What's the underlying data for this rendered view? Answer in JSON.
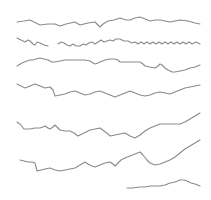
{
  "drawing": {
    "background": "#ffffff",
    "stroke_color": "#8a8a8a",
    "stroke_width": 1.1,
    "line_count": 7,
    "lines": [
      {
        "id": "line-1",
        "points": "17,22 24,21 30,20 36,23 40,25 48,24 55,24 60,26 66,24 75,22 80,25 88,23 95,22 100,27 103,24 108,21 114,20 120,18 126,20 130,20 135,18 140,17 145,19 150,21 155,20 160,20 165,21 170,22 175,21 180,20 188,21 195,23 200,24"
      },
      {
        "id": "line-2",
        "points": "17,38 21,40 25,42 28,40 30,41 33,44 35,45 37,42 40,43 44,45 48,46"
      },
      {
        "id": "line-2b",
        "points": "58,44 61,42 64,43 67,45 70,46 73,44 76,46 80,46 83,44 86,45 89,43 92,42 95,44 98,42 101,40 104,42 107,41 110,40 113,41 116,39 120,39 124,41 128,41 132,43 135,42 138,44 141,42 144,44 147,42 150,44 153,42 156,44 159,42 162,44 165,42 168,44 171,42 174,44 177,42 180,44 183,42 186,44 189,42 192,44 196,42 200,44"
      },
      {
        "id": "line-3",
        "points": "17,66 22,63 27,61 30,60 33,60 36,59 40,58 44,59 48,60 52,62 55,62 60,61 65,60 70,60 75,60 80,60 85,60 90,61 93,63 95,64 98,63 100,62 105,60 110,59 115,59 118,60 120,62 125,62 130,62 135,62 140,62 143,64 145,66 150,67 155,68 158,66 160,64 162,65 165,68 168,70 172,72 175,72 180,71 185,70 190,68 195,67 200,65"
      },
      {
        "id": "line-4",
        "points": "17,84 21,86 25,88 30,86 35,84 40,86 45,88 50,87 53,90 55,96 60,95 65,94 70,92 75,91 80,93 85,95 90,94 95,92 100,91 105,93 110,95 115,97 120,95 125,93 130,91 135,93 140,95 145,96 150,95 155,93 160,92 165,93 170,94 175,92 180,90 185,88 190,87 195,86 200,85"
      },
      {
        "id": "line-5",
        "points": "17,122 20,124 24,129 30,129 35,128 40,128 43,127 45,126 48,128 50,129 53,127 55,125 58,128 60,130 65,131 70,131 74,133 78,136 82,134 86,132 90,130 95,129 100,128 104,131 108,134 110,136 115,135 120,134 125,133 130,136 135,138 140,135 145,131 150,128 155,126 160,124 165,124 170,124 175,124 180,124 185,122 190,119 195,116 200,113"
      },
      {
        "id": "line-6",
        "points": "20,160 24,161 28,162 32,162 35,163 36,167 37,171 41,170 45,169 50,168 55,170 60,171 65,170 70,169 75,168 80,165 85,162 88,164 92,166 95,167 100,165 105,163 110,162 113,164 115,166 118,163 121,160 125,158 130,156 135,154 140,152 143,155 147,160 150,163 155,165 160,164 165,162 170,160 175,157 180,153 185,149 190,146 195,143 200,140"
      },
      {
        "id": "line-7",
        "points": "127,188 133,188 139,187 145,187 150,186 155,186 160,186 165,185 170,183 175,182 180,180 184,180 187,181 191,183 195,184 200,186"
      }
    ]
  }
}
